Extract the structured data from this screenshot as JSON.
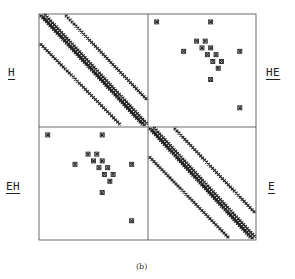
{
  "figure": {
    "caption": "(b)",
    "blocks": {
      "top_left": "H",
      "top_right": "HE",
      "bottom_left": "EH",
      "bottom_right": "E"
    },
    "frame": {
      "left": 39,
      "top": 14,
      "right": 256,
      "bottom": 240,
      "split_x": 148,
      "split_y": 127
    },
    "ink_color": "#222222",
    "offdiag_points": [
      [
        0.08,
        0.07
      ],
      [
        0.58,
        0.07
      ],
      [
        0.33,
        0.33
      ],
      [
        0.85,
        0.33
      ],
      [
        0.58,
        0.58
      ],
      [
        0.85,
        0.83
      ]
    ],
    "offdiag_cluster": [
      [
        0.45,
        0.24
      ],
      [
        0.5,
        0.3
      ],
      [
        0.55,
        0.36
      ],
      [
        0.6,
        0.42
      ],
      [
        0.65,
        0.48
      ],
      [
        0.53,
        0.24
      ],
      [
        0.58,
        0.3
      ],
      [
        0.63,
        0.36
      ],
      [
        0.68,
        0.42
      ]
    ]
  }
}
